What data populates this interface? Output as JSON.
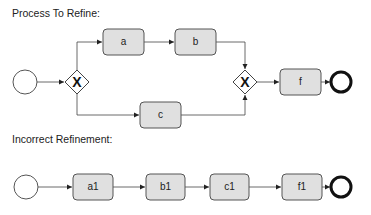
{
  "diagrams": [
    {
      "title": "Process To Refine:",
      "nodes": {
        "start": {
          "type": "start-event"
        },
        "gw_split": {
          "type": "exclusive-gateway",
          "symbol": "X"
        },
        "a": {
          "type": "task",
          "label": "a"
        },
        "b": {
          "type": "task",
          "label": "b"
        },
        "c": {
          "type": "task",
          "label": "c"
        },
        "gw_join": {
          "type": "exclusive-gateway",
          "symbol": "X"
        },
        "f": {
          "type": "task",
          "label": "f"
        },
        "end": {
          "type": "end-event"
        }
      },
      "flows": [
        [
          "start",
          "gw_split"
        ],
        [
          "gw_split",
          "a"
        ],
        [
          "a",
          "b"
        ],
        [
          "b",
          "gw_join"
        ],
        [
          "gw_split",
          "c"
        ],
        [
          "c",
          "gw_join"
        ],
        [
          "gw_join",
          "f"
        ],
        [
          "f",
          "end"
        ]
      ]
    },
    {
      "title": "Incorrect Refinement:",
      "nodes": {
        "start": {
          "type": "start-event"
        },
        "a1": {
          "type": "task",
          "label": "a1"
        },
        "b1": {
          "type": "task",
          "label": "b1"
        },
        "c1": {
          "type": "task",
          "label": "c1"
        },
        "f1": {
          "type": "task",
          "label": "f1"
        },
        "end": {
          "type": "end-event"
        }
      },
      "flows": [
        [
          "start",
          "a1"
        ],
        [
          "a1",
          "b1"
        ],
        [
          "b1",
          "c1"
        ],
        [
          "c1",
          "f1"
        ],
        [
          "f1",
          "end"
        ]
      ]
    }
  ],
  "colors": {
    "task_fill": "#e0e0e0",
    "stroke": "#444444"
  }
}
